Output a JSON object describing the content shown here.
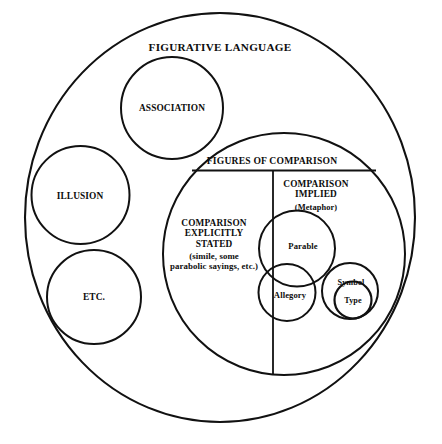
{
  "diagram": {
    "type": "euler-venn-diagram",
    "title": "FIGURATIVE LANGUAGE",
    "stroke_color": "#111111",
    "background_color": "#ffffff",
    "regions": {
      "outer": {
        "label": "FIGURATIVE LANGUAGE"
      },
      "association": {
        "label": "ASSOCIATION"
      },
      "illusion": {
        "label": "ILLUSION"
      },
      "etc": {
        "label": "ETC."
      },
      "figures_of_comparison": {
        "label": "FIGURES OF COMPARISON"
      },
      "comparison_explicit": {
        "label": "COMPARISON\nEXPLICITLY\nSTATED",
        "note": "(simile, some\nparabolic sayings, etc.)"
      },
      "comparison_implied": {
        "label": "COMPARISON\nIMPLIED",
        "note": "(Metaphor)"
      },
      "parable": {
        "label": "Parable"
      },
      "allegory": {
        "label": "Allegory"
      },
      "symbol": {
        "label": "Symbol"
      },
      "type": {
        "label": "Type"
      }
    }
  }
}
